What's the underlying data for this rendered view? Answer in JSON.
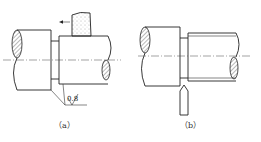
{
  "figure": {
    "panels": [
      {
        "id": "a",
        "caption": "（a）",
        "roughness_value": "0.8",
        "tool": "grinding-wheel",
        "feed_direction": "left"
      },
      {
        "id": "b",
        "caption": "（b）",
        "tool": "grooving-cutter"
      }
    ]
  }
}
